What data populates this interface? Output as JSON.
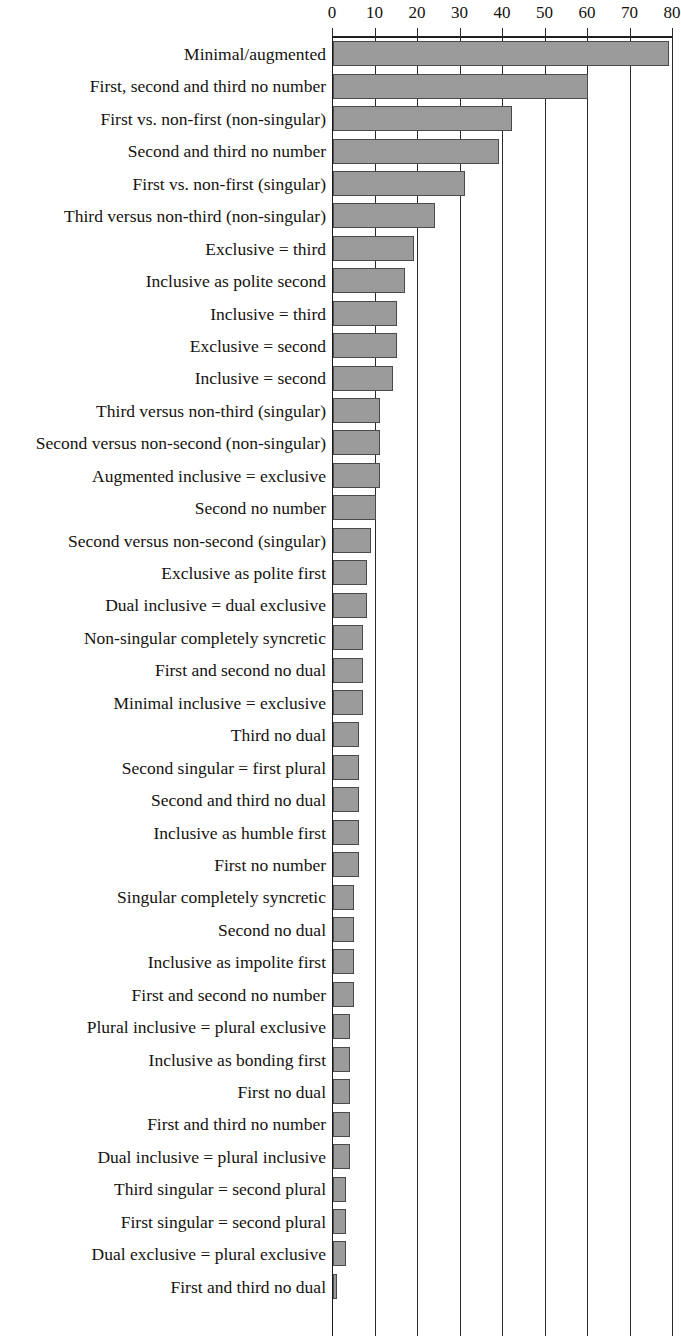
{
  "chart_data": {
    "type": "bar",
    "orientation": "horizontal",
    "title": "",
    "subtitle": "",
    "xlabel": "",
    "ylabel": "",
    "xlim": [
      0,
      80
    ],
    "xticks": [
      0,
      10,
      20,
      30,
      40,
      50,
      60,
      70,
      80
    ],
    "xtick_labels": [
      "0",
      "10",
      "20",
      "30",
      "40",
      "50",
      "60",
      "70",
      "80"
    ],
    "grid": true,
    "grid_axis": "x",
    "legend": false,
    "axis_position": "top",
    "bar_fill_color": "#9b9b9b",
    "bar_border_color": "#4a4a4a",
    "categories": [
      "Minimal/augmented",
      "First, second and third no number",
      "First vs. non-first (non-singular)",
      "Second and third no number",
      "First vs. non-first (singular)",
      "Third versus non-third (non-singular)",
      "Exclusive = third",
      "Inclusive as polite second",
      "Inclusive = third",
      "Exclusive = second",
      "Inclusive = second",
      "Third versus non-third (singular)",
      "Second versus non-second (non-singular)",
      "Augmented inclusive = exclusive",
      "Second no number",
      "Second versus non-second (singular)",
      "Exclusive as polite first",
      "Dual inclusive = dual exclusive",
      "Non-singular completely syncretic",
      "First and second no dual",
      "Minimal inclusive = exclusive",
      "Third no dual",
      "Second singular = first plural",
      "Second and third no dual",
      "Inclusive as humble first",
      "First no number",
      "Singular completely syncretic",
      "Second no dual",
      "Inclusive as impolite first",
      "First and second no number",
      "Plural inclusive = plural exclusive",
      "Inclusive as bonding first",
      "First no dual",
      "First and third no number",
      "Dual inclusive = plural inclusive",
      "Third singular = second plural",
      "First singular = second plural",
      "Dual exclusive = plural exclusive",
      "First and third no dual"
    ],
    "values": [
      79,
      60,
      42,
      39,
      31,
      24,
      19,
      17,
      15,
      15,
      14,
      11,
      11,
      11,
      10,
      9,
      8,
      8,
      7,
      7,
      7,
      6,
      6,
      6,
      6,
      6,
      5,
      5,
      5,
      5,
      4,
      4,
      4,
      4,
      4,
      3,
      3,
      3,
      1
    ]
  }
}
